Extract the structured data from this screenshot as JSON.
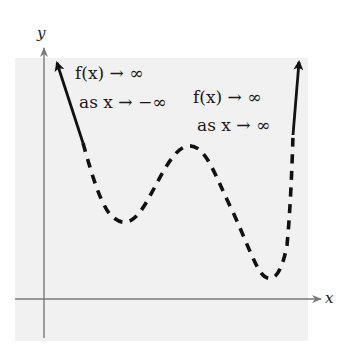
{
  "figure": {
    "axes": {
      "x_label": "x",
      "y_label": "y"
    },
    "annotations": {
      "left": {
        "line1": "f(x) → ∞",
        "line2": "as x → −∞"
      },
      "right": {
        "line1": "f(x) → ∞",
        "line2": "as x → ∞"
      }
    },
    "colors": {
      "panel": "#f1f1f1",
      "axis": "#7a7a7a",
      "curve": "#111111"
    },
    "curve": {
      "description": "Even-degree polynomial end behavior: rises on both ends, two local minima and one local maximum",
      "left_arrow_end": [
        56,
        60
      ],
      "local_min_1": [
        125,
        222
      ],
      "local_max": [
        190,
        146
      ],
      "local_min_2": [
        270,
        277
      ],
      "right_arrow_end": [
        299,
        59
      ]
    }
  }
}
